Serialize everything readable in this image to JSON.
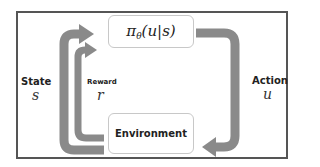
{
  "diagram": {
    "type": "reinforcement-learning-loop",
    "policy": {
      "symbol": "π",
      "subscript": "θ",
      "args": "(u|s)",
      "full": "π_θ(u|s)"
    },
    "environment": {
      "label": "Environment"
    },
    "state": {
      "label": "State",
      "symbol": "s"
    },
    "reward": {
      "label": "Reward",
      "symbol": "r"
    },
    "action": {
      "label": "Action",
      "symbol": "u"
    },
    "colors": {
      "arrow": "#8a8a8a",
      "frame": "#555555",
      "box_border": "#c8c8c8"
    }
  }
}
